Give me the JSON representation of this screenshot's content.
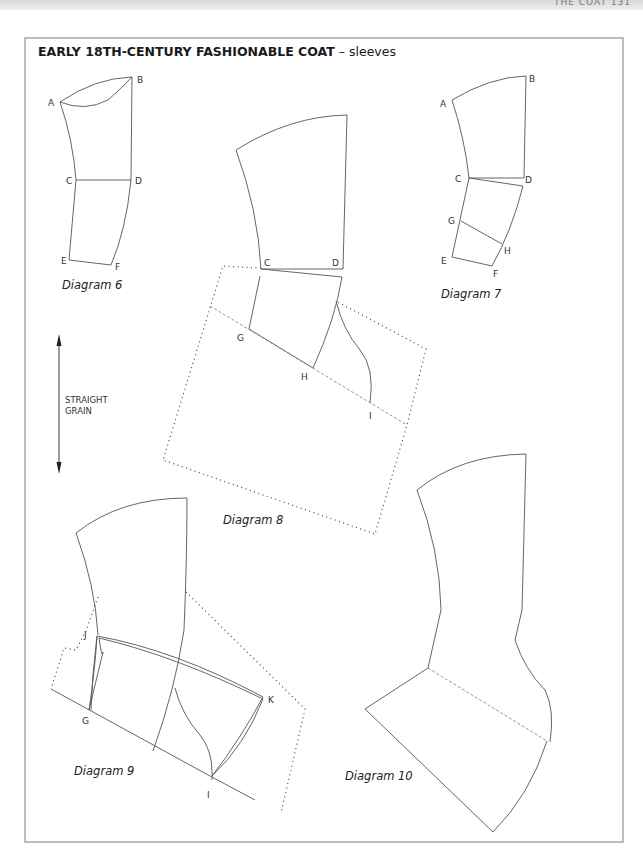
{
  "page": {
    "running_head": "THE COAT 131"
  },
  "figure": {
    "title_main": "EARLY 18TH-CENTURY FASHIONABLE COAT",
    "title_sep": " – ",
    "title_sub": "sleeves",
    "grain_label_line1": "STRAIGHT",
    "grain_label_line2": "GRAIN"
  },
  "diagrams": [
    {
      "id": 6,
      "caption": "Diagram 6",
      "points": [
        "A",
        "B",
        "C",
        "D",
        "E",
        "F"
      ]
    },
    {
      "id": 7,
      "caption": "Diagram 7",
      "points": [
        "A",
        "B",
        "C",
        "D",
        "G",
        "H",
        "E",
        "F"
      ]
    },
    {
      "id": 8,
      "caption": "Diagram 8",
      "points": [
        "C",
        "D",
        "G",
        "H",
        "I"
      ]
    },
    {
      "id": 9,
      "caption": "Diagram 9",
      "points": [
        "J",
        "G",
        "K",
        "I"
      ]
    },
    {
      "id": 10,
      "caption": "Diagram 10",
      "points": []
    }
  ],
  "labels": {
    "d6": {
      "A": "A",
      "B": "B",
      "C": "C",
      "D": "D",
      "E": "E",
      "F": "F"
    },
    "d7": {
      "A": "A",
      "B": "B",
      "C": "C",
      "D": "D",
      "G": "G",
      "H": "H",
      "E": "E",
      "F": "F"
    },
    "d8": {
      "C": "C",
      "D": "D",
      "G": "G",
      "H": "H",
      "I": "I"
    },
    "d9": {
      "J": "J",
      "G": "G",
      "K": "K",
      "I": "I"
    }
  },
  "colors": {
    "line": "#555555",
    "frame": "#bdbdbd",
    "dotted": "#444444"
  }
}
